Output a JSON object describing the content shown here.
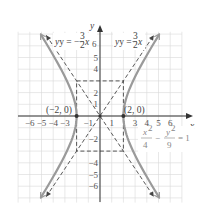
{
  "chart_data": {
    "type": "line",
    "title": "",
    "xlabel": "x",
    "ylabel": "y",
    "xlim": [
      -7,
      7
    ],
    "ylim": [
      -7.5,
      7.2
    ],
    "grid": true,
    "x_ticks": [
      "-6",
      "-5",
      "-4",
      "-3",
      "-1",
      "1",
      "3",
      "4",
      "5",
      "6"
    ],
    "y_ticks": [
      "6",
      "5",
      "4",
      "2",
      "1",
      "-2",
      "-4",
      "-5",
      "-6"
    ],
    "series": [
      {
        "name": "hyperbola",
        "equation": "x^2/4 - y^2/9 = 1",
        "style": "solid",
        "color": "#999999"
      },
      {
        "name": "asymptote_pos",
        "equation": "y = 3/2 x",
        "style": "dashed",
        "color": "#444444"
      },
      {
        "name": "asymptote_neg",
        "equation": "y = -3/2 x",
        "style": "dashed",
        "color": "#444444"
      },
      {
        "name": "fundamental_rectangle",
        "corners": [
          [
            -2,
            3
          ],
          [
            2,
            3
          ],
          [
            2,
            -3
          ],
          [
            -2,
            -3
          ]
        ],
        "style": "dashed",
        "color": "#444444"
      }
    ],
    "points": [
      {
        "label": "(-2, 0)",
        "x": -2,
        "y": 0
      },
      {
        "label": "(2, 0)",
        "x": 2,
        "y": 0
      }
    ],
    "annotations": [
      {
        "text": "y = -3/2 x",
        "position": "upper-left"
      },
      {
        "text": "y = 3/2 x",
        "position": "upper-right"
      },
      {
        "text": "x^2/4 - y^2/9 = 1",
        "position": "right-middle"
      }
    ]
  },
  "labels": {
    "x_axis": "x",
    "y_axis": "y",
    "vertex_left": "(−2, 0)",
    "vertex_right": "(2, 0)",
    "asym_neg_prefix": "y = −",
    "asym_pos_prefix": "y = ",
    "frac_num": "3",
    "frac_den": "2",
    "var_x": "x",
    "eq_x2": "x",
    "eq_y2": "y",
    "eq_sup": "2",
    "eq_den_x": "4",
    "eq_den_y": "9",
    "eq_minus": "−",
    "eq_rhs": "= 1"
  },
  "ticks": {
    "x": [
      {
        "v": -6,
        "t": "−6"
      },
      {
        "v": -5,
        "t": "−5"
      },
      {
        "v": -4,
        "t": "−4"
      },
      {
        "v": -3,
        "t": "−3"
      },
      {
        "v": -1,
        "t": "−1"
      },
      {
        "v": 1,
        "t": "1"
      },
      {
        "v": 3,
        "t": "3"
      },
      {
        "v": 4,
        "t": "4"
      },
      {
        "v": 5,
        "t": "5"
      },
      {
        "v": 6,
        "t": "6"
      }
    ],
    "y": [
      {
        "v": 6,
        "t": "6"
      },
      {
        "v": 5,
        "t": "5"
      },
      {
        "v": 4,
        "t": "4"
      },
      {
        "v": 2,
        "t": "2"
      },
      {
        "v": 1,
        "t": "1"
      },
      {
        "v": -2,
        "t": "−2"
      },
      {
        "v": -4,
        "t": "−4"
      },
      {
        "v": -5,
        "t": "−5"
      },
      {
        "v": -6,
        "t": "−6"
      }
    ]
  }
}
